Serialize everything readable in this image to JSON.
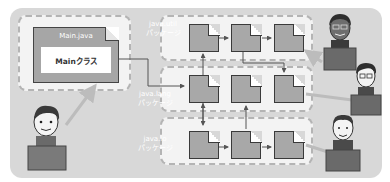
{
  "main_file": {
    "filename": "Main.java",
    "class_label": "Mainクラス"
  },
  "packages": [
    {
      "name": "java.util",
      "label_suffix": "パッケージ",
      "files": 3
    },
    {
      "name": "java.lang",
      "label_suffix": "パッケージ",
      "files": 3
    },
    {
      "name": "java.io",
      "label_suffix": "パッケージ",
      "files": 3
    }
  ],
  "colors": {
    "panel": "#d8d8d8",
    "dotted_box": "#f3f3f3",
    "file_fill": "#a8a8a8",
    "file_border": "#3a3a3a",
    "arrow": "#555555",
    "connector": "#bdbdbd"
  }
}
